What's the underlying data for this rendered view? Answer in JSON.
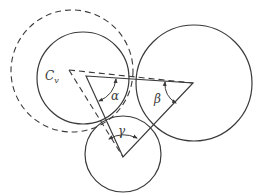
{
  "diagram": {
    "type": "geometry",
    "colors": {
      "stroke": "#3a3a3a",
      "background": "#ffffff"
    },
    "labels": {
      "cv_main": "C",
      "cv_sub": "v",
      "alpha": "α",
      "beta": "β",
      "gamma": "γ"
    },
    "circles": [
      {
        "name": "left-circle",
        "cx": 83,
        "cy": 78,
        "r": 46,
        "style": "solid"
      },
      {
        "name": "right-circle",
        "cx": 194,
        "cy": 83,
        "r": 58,
        "style": "solid"
      },
      {
        "name": "bottom-circle",
        "cx": 123,
        "cy": 154,
        "r": 38,
        "style": "solid"
      },
      {
        "name": "dashed-circle",
        "cx": 72,
        "cy": 71,
        "r": 61,
        "style": "dashed"
      }
    ],
    "triangle_solid": [
      [
        86,
        76
      ],
      [
        193,
        83
      ],
      [
        123,
        157
      ]
    ],
    "triangle_dashed_vertex": [
      69,
      70
    ],
    "angles": [
      "α",
      "β",
      "γ"
    ]
  }
}
